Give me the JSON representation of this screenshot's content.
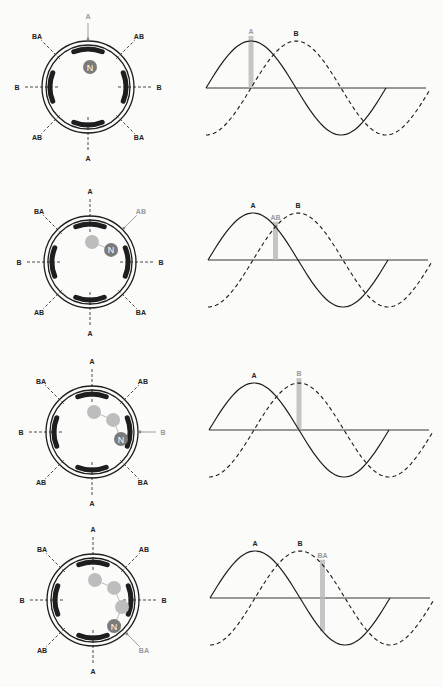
{
  "colors": {
    "ink": "#1e1e1e",
    "magnet": "#7b7b7b",
    "ghost": "#bdbdbd",
    "highlight": "#b8b8b8",
    "background": "#fbfbf9"
  },
  "panels": [
    {
      "id": 1,
      "stator_labels": {
        "top": "A",
        "bottom": "A",
        "left": "B",
        "right": "B",
        "top_left": "BA",
        "top_right": "AB",
        "bottom_left": "AB",
        "bottom_right": "BA"
      },
      "active_label": "A",
      "active_position": "top",
      "rotor": {
        "label": "N",
        "ghost_count": 0
      },
      "wave_labels": {
        "a": "A",
        "b": "B"
      },
      "marker_label": "A",
      "marker_phase_deg": 90
    },
    {
      "id": 2,
      "stator_labels": {
        "top": "A",
        "bottom": "A",
        "left": "B",
        "right": "B",
        "top_left": "BA",
        "top_right": "AB",
        "bottom_left": "AB",
        "bottom_right": "BA"
      },
      "active_label": "AB",
      "active_position": "top_right",
      "rotor": {
        "label": "N",
        "ghost_count": 1
      },
      "wave_labels": {
        "a": "A",
        "b": "B"
      },
      "marker_label": "AB",
      "marker_phase_deg": 135
    },
    {
      "id": 3,
      "stator_labels": {
        "top": "A",
        "bottom": "A",
        "left": "B",
        "right": "B",
        "top_left": "BA",
        "top_right": "AB",
        "bottom_left": "AB",
        "bottom_right": "BA"
      },
      "active_label": "B",
      "active_position": "right",
      "rotor": {
        "label": "N",
        "ghost_count": 2
      },
      "wave_labels": {
        "a": "A",
        "b": "B"
      },
      "marker_label": "B",
      "marker_phase_deg": 180
    },
    {
      "id": 4,
      "stator_labels": {
        "top": "A",
        "bottom": "A",
        "left": "B",
        "right": "B",
        "top_left": "BA",
        "top_right": "AB",
        "bottom_left": "AB",
        "bottom_right": "BA"
      },
      "active_label": "BA",
      "active_position": "bottom_right",
      "rotor": {
        "label": "N",
        "ghost_count": 3
      },
      "wave_labels": {
        "a": "A",
        "b": "B"
      },
      "marker_label": "BA",
      "marker_phase_deg": 225
    }
  ],
  "waveform": {
    "phase_a": "sine (solid)",
    "phase_b": "sine lagging 90° (dashed)",
    "cycles_shown": 1
  }
}
